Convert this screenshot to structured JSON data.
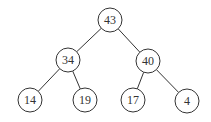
{
  "diagram": {
    "type": "binary-tree",
    "colors": {
      "stroke": "#333333",
      "fill": "#ffffff",
      "text": "#333333"
    },
    "node_radius": 12,
    "nodes": [
      {
        "id": "n0",
        "label": "43",
        "x": 110,
        "y": 20
      },
      {
        "id": "n1",
        "label": "34",
        "x": 68,
        "y": 60
      },
      {
        "id": "n2",
        "label": "40",
        "x": 148,
        "y": 61
      },
      {
        "id": "n3",
        "label": "14",
        "x": 30,
        "y": 100
      },
      {
        "id": "n4",
        "label": "19",
        "x": 85,
        "y": 100
      },
      {
        "id": "n5",
        "label": "17",
        "x": 133,
        "y": 100
      },
      {
        "id": "n6",
        "label": "4",
        "x": 187,
        "y": 101
      }
    ],
    "edges": [
      {
        "from": "n0",
        "to": "n1"
      },
      {
        "from": "n0",
        "to": "n2"
      },
      {
        "from": "n1",
        "to": "n3"
      },
      {
        "from": "n1",
        "to": "n4"
      },
      {
        "from": "n2",
        "to": "n5"
      },
      {
        "from": "n2",
        "to": "n6"
      }
    ]
  }
}
